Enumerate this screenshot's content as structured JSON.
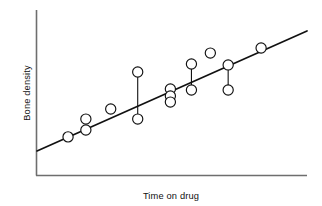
{
  "chart_data": {
    "type": "scatter",
    "title": "",
    "xlabel": "Time on drug",
    "ylabel": "Bone density",
    "grid": false,
    "legend": null,
    "axes": {
      "x_ticks": [],
      "y_ticks": [],
      "x_range_px": [
        36,
        307
      ],
      "y_range_px": [
        10,
        175
      ],
      "note": "Axes are unlabeled/schematic: no numeric tick marks are printed."
    },
    "trend_line": {
      "label": "regression line",
      "x_start": 0.0,
      "y_start": 0.146,
      "x_end": 1.0,
      "y_end": 0.873,
      "color": "#111111"
    },
    "points": [
      {
        "id": "p1",
        "x": 0.115,
        "y": 0.231,
        "fit_y": 0.23,
        "residual": 0.001
      },
      {
        "id": "p2",
        "x": 0.181,
        "y": 0.339,
        "fit_y": 0.278,
        "residual": 0.061
      },
      {
        "id": "p3",
        "x": 0.181,
        "y": 0.273,
        "fit_y": 0.278,
        "residual": -0.005
      },
      {
        "id": "p4",
        "x": 0.273,
        "y": 0.4,
        "fit_y": 0.344,
        "residual": 0.056
      },
      {
        "id": "p5",
        "x": 0.373,
        "y": 0.624,
        "fit_y": 0.417,
        "residual": 0.207
      },
      {
        "id": "p6",
        "x": 0.373,
        "y": 0.339,
        "fit_y": 0.417,
        "residual": -0.078
      },
      {
        "id": "p7",
        "x": 0.494,
        "y": 0.521,
        "fit_y": 0.505,
        "residual": 0.016
      },
      {
        "id": "p8",
        "x": 0.494,
        "y": 0.479,
        "fit_y": 0.505,
        "residual": -0.026
      },
      {
        "id": "p9",
        "x": 0.494,
        "y": 0.442,
        "fit_y": 0.505,
        "residual": -0.063
      },
      {
        "id": "p10",
        "x": 0.572,
        "y": 0.673,
        "fit_y": 0.562,
        "residual": 0.111
      },
      {
        "id": "p11",
        "x": 0.572,
        "y": 0.515,
        "fit_y": 0.562,
        "residual": -0.047
      },
      {
        "id": "p12",
        "x": 0.642,
        "y": 0.739,
        "fit_y": 0.613,
        "residual": 0.126
      },
      {
        "id": "p13",
        "x": 0.708,
        "y": 0.667,
        "fit_y": 0.661,
        "residual": 0.006
      },
      {
        "id": "p14",
        "x": 0.708,
        "y": 0.515,
        "fit_y": 0.661,
        "residual": -0.146
      },
      {
        "id": "p15",
        "x": 0.83,
        "y": 0.77,
        "fit_y": 0.75,
        "residual": 0.02
      }
    ],
    "residual_segments": [
      {
        "x": 0.373,
        "y_top": 0.624,
        "y_bottom": 0.339
      },
      {
        "x": 0.494,
        "y_top": 0.521,
        "y_bottom": 0.442
      },
      {
        "x": 0.572,
        "y_top": 0.673,
        "y_bottom": 0.515
      },
      {
        "x": 0.708,
        "y_top": 0.667,
        "y_bottom": 0.515
      }
    ],
    "marker": {
      "shape": "circle",
      "radius_px": 5.1,
      "fill": "#ffffff",
      "edge": "#111111"
    }
  },
  "colors": {
    "background": "#ffffff",
    "axis": "#6e6e6e",
    "ink": "#111111"
  }
}
